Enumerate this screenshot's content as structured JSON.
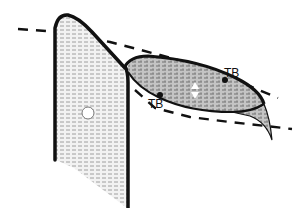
{
  "diagram": {
    "type": "schematic cross-section",
    "labels": [
      {
        "id": "tb-upper",
        "text": "TB",
        "x": 224,
        "y": 77
      },
      {
        "id": "tb-lower",
        "text": "TB",
        "x": 150,
        "y": 107
      }
    ],
    "markers": [
      {
        "id": "open-circle",
        "shape": "circle",
        "x": 88,
        "y": 113
      },
      {
        "id": "double-arrow",
        "shape": "up-down-arrow",
        "x": 195,
        "y": 90
      }
    ],
    "colors": {
      "outline": "#111111",
      "fill_light": "#e6e6e6",
      "fill_dark": "#b5b5b5",
      "dash": "#111111",
      "background": "#ffffff"
    }
  }
}
